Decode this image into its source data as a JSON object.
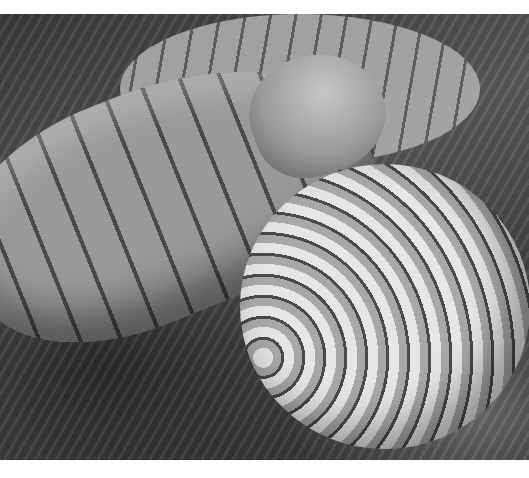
{
  "image": {
    "description": "Grayscale scanning electron micrograph of a segmented worm-like creature coiled in a spiral on a fibrous surface",
    "palette": {
      "background": "#ffffff",
      "highlight": "#e6e6e6",
      "midtone": "#8a8a8a",
      "shadow": "#2a2a2a"
    }
  }
}
